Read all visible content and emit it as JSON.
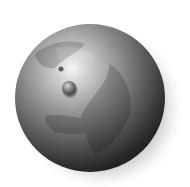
{
  "image": {
    "subject": "globe",
    "description": "Grayscale 3D globe showing Europe and Africa with a small spherical marker",
    "colors": {
      "background": "#ffffff",
      "highlight": "#f4f4f4",
      "midtone": "#5e5e5e",
      "shadow": "#050505"
    }
  }
}
